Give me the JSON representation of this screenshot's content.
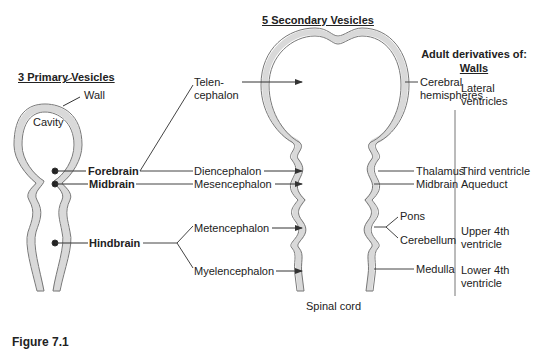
{
  "titles": {
    "primary": "3 Primary Vesicles",
    "secondary": "5 Secondary Vesicles",
    "adult_line1": "Adult derivatives of:",
    "adult_line2": "Walls"
  },
  "primary": {
    "wall": "Wall",
    "cavity": "Cavity",
    "items": [
      "Forebrain",
      "Midbrain",
      "Hindbrain"
    ]
  },
  "secondary": {
    "telen_1": "Telen-",
    "telen_2": "cephalon",
    "items": [
      "Diencephalon",
      "Mesencephalon",
      "Metencephalon",
      "Myelencephalon"
    ],
    "spinal": "Spinal cord"
  },
  "walls": {
    "cerebral_1": "Cerebral",
    "cerebral_2": "hemispheres",
    "thalamus": "Thalamus",
    "midbrain": "Midbrain",
    "pons": "Pons",
    "cerebellum": "Cerebellum",
    "medulla": "Medulla"
  },
  "cavities": {
    "lateral_1": "Lateral",
    "lateral_2": "ventricles",
    "third": "Third ventricle",
    "aqueduct": "Aqueduct",
    "upper_1": "Upper 4th",
    "upper_2": "ventricle",
    "lower_1": "Lower 4th",
    "lower_2": "ventricle"
  },
  "caption": "Figure 7.1",
  "colors": {
    "wall_fill": "#d9d9d9",
    "stroke": "#555555",
    "text": "#222222"
  }
}
